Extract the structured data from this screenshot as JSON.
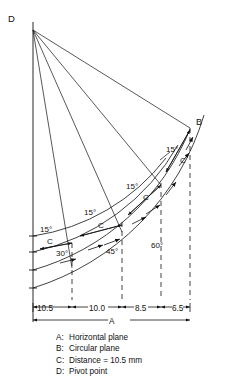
{
  "figure": {
    "points": {
      "D": "D",
      "B": "B",
      "C_upper": "C",
      "C_mid": "C",
      "C_lower": "C"
    },
    "angle_increments": [
      "15°",
      "15°",
      "15°",
      "15°"
    ],
    "arc_angles": [
      "30°",
      "45°",
      "60°"
    ],
    "dimensions": {
      "segments": [
        "10.5",
        "10.0",
        "8.5",
        "6.5"
      ],
      "overall_label": "A"
    }
  },
  "legend": [
    {
      "key": "A:",
      "value": "Horizontal plane"
    },
    {
      "key": "B:",
      "value": "Circular plane"
    },
    {
      "key": "C:",
      "value": "Distance = 10.5 mm"
    },
    {
      "key": "D:",
      "value": "Pivot point"
    }
  ],
  "colors": {
    "line": "#111111",
    "background": "#ffffff"
  }
}
